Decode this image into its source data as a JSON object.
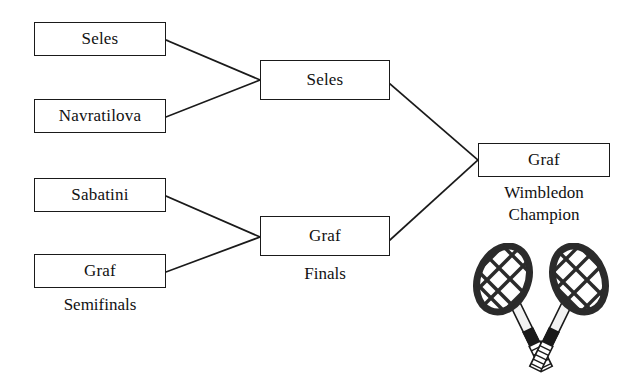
{
  "diagram": {
    "ink_color": "#1a1a1a",
    "background_color": "#ffffff"
  },
  "rounds": {
    "semifinals_label": "Semifinals",
    "finals_label": "Finals"
  },
  "semifinals": {
    "match1": {
      "player_top": "Seles",
      "player_bottom": "Navratilova"
    },
    "match2": {
      "player_top": "Sabatini",
      "player_bottom": "Graf"
    }
  },
  "finals": {
    "winner_top": "Seles",
    "winner_bottom": "Graf"
  },
  "champion": {
    "name": "Graf",
    "caption_line1": "Wimbledon",
    "caption_line2": "Champion"
  },
  "decoration": {
    "rackets_icon": "crossed-tennis-rackets"
  }
}
